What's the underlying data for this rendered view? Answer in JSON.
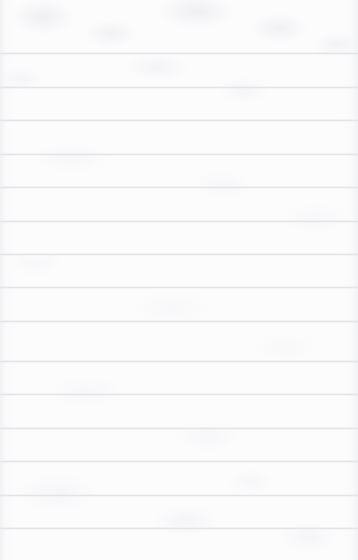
{
  "document": {
    "kind": "ruled-paper-sheet",
    "title": "Blank Ruled Paper",
    "content_text": "",
    "is_blank": true,
    "width_px": 358,
    "height_px": 560
  },
  "paper": {
    "background_color": "#fcfcfd",
    "texture": "subtle-mottled-grain",
    "has_margin_rule": false,
    "has_holes": false,
    "top_margin_px": 53,
    "bottom_margin_px": 32
  },
  "rules": {
    "color": "#e3e4e7",
    "thickness_px": 1,
    "spacing_px": 33.5,
    "count": 15,
    "full_bleed": true,
    "y_positions": [
      53,
      87,
      120,
      154,
      187,
      221,
      254,
      287,
      321,
      361,
      394,
      428,
      461,
      495,
      528
    ]
  }
}
